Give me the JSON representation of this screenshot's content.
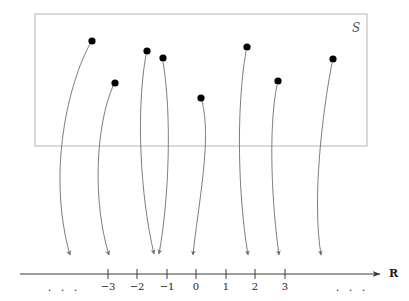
{
  "figure": {
    "background_color": "#ffffff"
  },
  "set_box": {
    "label": "Ʒ",
    "label_text": "S",
    "border_color": "#b5b5b5",
    "x": 35,
    "y": 14,
    "width": 332,
    "height": 132
  },
  "points": [
    {
      "name": "point-1",
      "x": 92,
      "y": 41,
      "target": 77,
      "label": ""
    },
    {
      "name": "point-2",
      "x": 115,
      "y": 83,
      "target": 113,
      "label": ""
    },
    {
      "name": "point-3",
      "x": 147,
      "y": 51,
      "target": 155,
      "label": ""
    },
    {
      "name": "point-4",
      "x": 163,
      "y": 58,
      "target": 159,
      "label": ""
    },
    {
      "name": "point-5",
      "x": 201,
      "y": 98,
      "target": 194,
      "label": ""
    },
    {
      "name": "point-6",
      "x": 247,
      "y": 47,
      "target": 249,
      "label": ""
    },
    {
      "name": "point-7",
      "x": 278,
      "y": 81,
      "target": 280,
      "label": ""
    },
    {
      "name": "point-8",
      "x": 333,
      "y": 59,
      "target": 322,
      "label": ""
    }
  ],
  "point_color": "#000000",
  "arrow_color": "#6e6e6e",
  "axis": {
    "label": "ℝ",
    "label_display": "R",
    "line_color": "#3a3a3a",
    "y": 274,
    "x_start": 20,
    "x_end": 385,
    "tick_spacing": 29.5,
    "zero_x": 196,
    "ticks": [
      {
        "value": "-3",
        "label": "−3",
        "x": 108
      },
      {
        "value": "-2",
        "label": "−2",
        "x": 137
      },
      {
        "value": "-1",
        "label": "−1",
        "x": 167
      },
      {
        "value": "0",
        "label": "0",
        "x": 196
      },
      {
        "value": "1",
        "label": "1",
        "x": 226
      },
      {
        "value": "2",
        "label": "2",
        "x": 255
      },
      {
        "value": "3",
        "label": "3",
        "x": 285
      }
    ],
    "ellipsis_left": {
      "label": ". . .",
      "x": 64
    },
    "ellipsis_right": {
      "label": ". . .",
      "x": 352
    }
  }
}
